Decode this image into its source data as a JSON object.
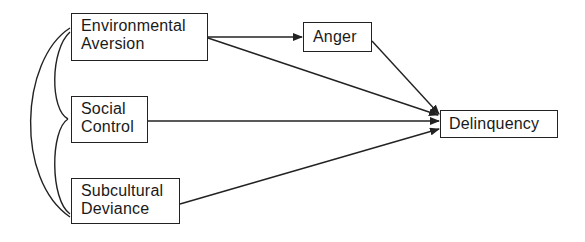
{
  "diagram": {
    "type": "path-model",
    "nodes": [
      {
        "id": "ea",
        "lines": [
          "Environmental",
          "Aversion"
        ]
      },
      {
        "id": "sc",
        "lines": [
          "Social",
          "Control"
        ]
      },
      {
        "id": "sd",
        "lines": [
          "Subcultural",
          "Deviance"
        ]
      },
      {
        "id": "an",
        "lines": [
          "Anger"
        ]
      },
      {
        "id": "de",
        "lines": [
          "Delinquency"
        ]
      }
    ],
    "edges": [
      {
        "from": "Environmental Aversion",
        "to": "Anger",
        "type": "directed"
      },
      {
        "from": "Environmental Aversion",
        "to": "Delinquency",
        "type": "directed"
      },
      {
        "from": "Anger",
        "to": "Delinquency",
        "type": "directed"
      },
      {
        "from": "Social Control",
        "to": "Delinquency",
        "type": "directed"
      },
      {
        "from": "Subcultural Deviance",
        "to": "Delinquency",
        "type": "directed"
      },
      {
        "from": "Environmental Aversion",
        "to": "Social Control",
        "type": "correlation"
      },
      {
        "from": "Social Control",
        "to": "Subcultural Deviance",
        "type": "correlation"
      },
      {
        "from": "Environmental Aversion",
        "to": "Subcultural Deviance",
        "type": "correlation"
      }
    ],
    "colors": {
      "stroke": "#222222",
      "background": "#ffffff"
    }
  }
}
